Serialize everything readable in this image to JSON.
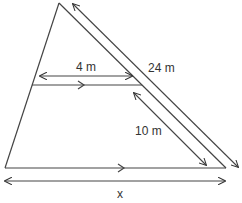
{
  "diagram": {
    "type": "similar-triangles",
    "labels": {
      "top_segment": "4 m",
      "side_full": "24 m",
      "side_lower": "10 m",
      "base": "x"
    },
    "colors": {
      "stroke": "#333333",
      "background": "#ffffff"
    }
  }
}
